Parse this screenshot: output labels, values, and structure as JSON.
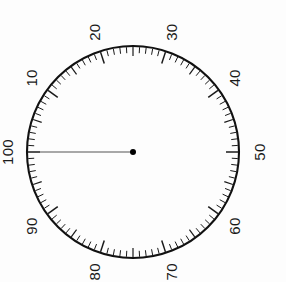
{
  "gauge": {
    "name": "circular-dial-gauge",
    "background_color": "#fdfdfd",
    "rim_color": "#111111",
    "tick_color": "#1a1a1a",
    "needle_color": "#555555",
    "hub_color": "#000000",
    "center_x": 133,
    "center_y": 152,
    "radius": 106,
    "scale_min": 0,
    "scale_max": 100,
    "minor_tick_step": 1,
    "major_tick_step": 5,
    "label_step": 10,
    "zero_angle_deg": 180,
    "direction": "clockwise",
    "label_rotation_deg": -90,
    "needle_value": 100,
    "needle_length": 104,
    "labels": [
      {
        "value": 10,
        "text": "10"
      },
      {
        "value": 20,
        "text": "20"
      },
      {
        "value": 30,
        "text": "30"
      },
      {
        "value": 40,
        "text": "40"
      },
      {
        "value": 50,
        "text": "50"
      },
      {
        "value": 60,
        "text": "60"
      },
      {
        "value": 70,
        "text": "70"
      },
      {
        "value": 80,
        "text": "80"
      },
      {
        "value": 90,
        "text": "90"
      },
      {
        "value": 100,
        "text": "100"
      }
    ]
  },
  "chart_data": {
    "type": "gauge",
    "title": "",
    "subtitle": "",
    "xlabel": "",
    "ylabel": "",
    "scale_min": 0,
    "scale_max": 100,
    "tick_labels": [
      "10",
      "20",
      "30",
      "40",
      "50",
      "60",
      "70",
      "80",
      "90",
      "100"
    ],
    "tick_values": [
      10,
      20,
      30,
      40,
      50,
      60,
      70,
      80,
      90,
      100
    ],
    "minor_tick_step": 1,
    "major_tick_step": 5,
    "series": [
      {
        "name": "needle",
        "values": [
          100
        ]
      }
    ],
    "reading": 100,
    "grid": false,
    "legend": "none",
    "annotations": []
  }
}
